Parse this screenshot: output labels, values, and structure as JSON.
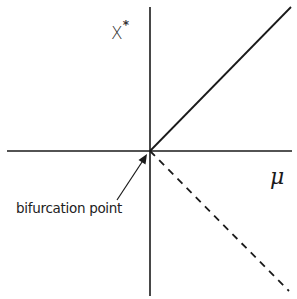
{
  "diagram": {
    "type": "bifurcation-diagram",
    "y_axis_label": "X",
    "y_axis_label_superscript": "*",
    "x_axis_label": "μ",
    "annotation": "bifurcation point",
    "branches": [
      {
        "name": "stable-branch",
        "style": "solid",
        "from": [
          0,
          0
        ],
        "direction": "up-right"
      },
      {
        "name": "unstable-branch",
        "style": "dashed",
        "from": [
          0,
          0
        ],
        "direction": "down-right"
      }
    ],
    "colors": {
      "line": "#1a1a1a",
      "background": "#ffffff"
    }
  }
}
